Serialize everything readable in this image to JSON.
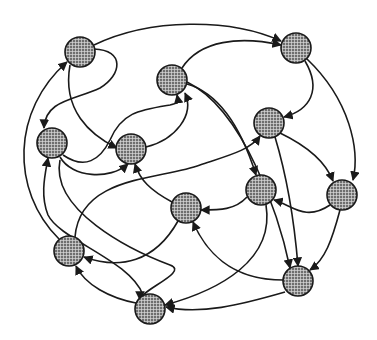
{
  "diagram": {
    "type": "directed-graph",
    "node_style": {
      "fill": "#6e6e6e",
      "grid": "#d8d8d8",
      "stroke": "#1a1a1a",
      "radius": 15
    },
    "edge_color": "#1a1a1a",
    "nodes": [
      {
        "id": "A",
        "x": 80,
        "y": 52
      },
      {
        "id": "B",
        "x": 296,
        "y": 48
      },
      {
        "id": "C",
        "x": 172,
        "y": 80
      },
      {
        "id": "D",
        "x": 52,
        "y": 143
      },
      {
        "id": "E",
        "x": 131,
        "y": 149
      },
      {
        "id": "F",
        "x": 269,
        "y": 123
      },
      {
        "id": "G",
        "x": 261,
        "y": 190
      },
      {
        "id": "H",
        "x": 342,
        "y": 195
      },
      {
        "id": "I",
        "x": 186,
        "y": 208
      },
      {
        "id": "J",
        "x": 69,
        "y": 251
      },
      {
        "id": "K",
        "x": 298,
        "y": 281
      },
      {
        "id": "L",
        "x": 150,
        "y": 309
      }
    ],
    "edges": [
      {
        "from": "A",
        "to": "B",
        "d": "M94,45 C150,18 230,18 281,41"
      },
      {
        "from": "C",
        "to": "B",
        "d": "M182,68 C200,40 240,36 281,45"
      },
      {
        "from": "A",
        "to": "D",
        "d": "M94,49 C125,50 122,75 100,88 C75,100 45,100 44,128"
      },
      {
        "from": "A",
        "to": "E",
        "d": "M70,65 C62,110 90,135 117,148"
      },
      {
        "from": "J",
        "to": "A",
        "d": "M59,239 C10,190 12,110 67,62"
      },
      {
        "from": "D",
        "to": "C",
        "d": "M63,155 C85,170 100,160 110,140 C122,112 140,110 170,105 C180,103 178,100 177,95"
      },
      {
        "from": "D",
        "to": "E",
        "d": "M60,157 C72,178 110,180 128,164"
      },
      {
        "from": "E",
        "to": "C",
        "d": "M146,147 C175,140 195,115 185,93"
      },
      {
        "from": "L",
        "to": "D",
        "d": "M143,295 C130,260 60,240 48,215 C40,195 45,175 48,158"
      },
      {
        "from": "B",
        "to": "F",
        "d": "M305,61 C322,90 310,110 284,117"
      },
      {
        "from": "B",
        "to": "H",
        "d": "M307,59 C350,100 360,150 353,180"
      },
      {
        "from": "C",
        "to": "G",
        "d": "M187,84 C225,95 245,140 256,175"
      },
      {
        "from": "F",
        "to": "H",
        "d": "M280,133 C305,145 325,160 333,181"
      },
      {
        "from": "F",
        "to": "K",
        "d": "M275,137 C288,180 295,230 298,266"
      },
      {
        "from": "J",
        "to": "F",
        "d": "M75,237 C80,175 160,180 200,165 C230,155 250,150 260,136"
      },
      {
        "from": "C",
        "to": "K",
        "d": "M187,82 C245,110 280,220 290,268"
      },
      {
        "from": "H",
        "to": "G",
        "d": "M330,205 C305,222 292,205 274,200"
      },
      {
        "from": "H",
        "to": "K",
        "d": "M340,210 C332,240 325,260 310,270"
      },
      {
        "from": "G",
        "to": "I",
        "d": "M247,197 C235,210 220,210 201,210"
      },
      {
        "from": "G",
        "to": "L",
        "d": "M266,205 C275,260 220,290 165,305"
      },
      {
        "from": "I",
        "to": "J",
        "d": "M178,221 C155,262 120,270 84,257"
      },
      {
        "from": "K",
        "to": "I",
        "d": "M283,280 C230,280 205,250 193,222"
      },
      {
        "from": "K",
        "to": "L",
        "d": "M285,292 C240,305 200,315 166,307"
      },
      {
        "from": "L",
        "to": "J",
        "d": "M136,303 C110,298 85,285 76,266"
      },
      {
        "from": "I",
        "to": "E",
        "d": "M172,202 C150,190 140,180 135,164"
      },
      {
        "from": "A",
        "to": "I",
        "d": "M60,160 C50,210 130,250 170,265 C190,272 140,290 140,300"
      }
    ]
  }
}
